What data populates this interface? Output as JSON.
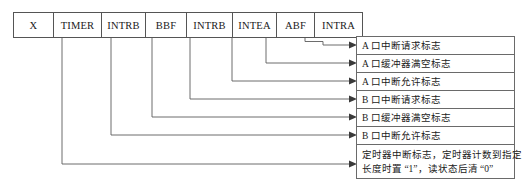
{
  "diagram": {
    "bitfield": {
      "cells": [
        {
          "label": "X",
          "width": 40
        },
        {
          "label": "TIMER",
          "width": 48
        },
        {
          "label": "INTRB",
          "width": 44
        },
        {
          "label": "BBF",
          "width": 41
        },
        {
          "label": "INTRB",
          "width": 46
        },
        {
          "label": "INTEA",
          "width": 44
        },
        {
          "label": "ABF",
          "width": 38
        },
        {
          "label": "INTRA",
          "width": 47
        }
      ]
    },
    "descriptions": [
      {
        "id": "intra",
        "text": "A 口中断请求标志"
      },
      {
        "id": "abf",
        "text": "A 口缓冲器满空标志"
      },
      {
        "id": "intea",
        "text": "A 口中断允许标志"
      },
      {
        "id": "intrb2",
        "text": "B 口中断请求标志"
      },
      {
        "id": "bbf",
        "text": "B 口缓冲器满空标志"
      },
      {
        "id": "intrb1",
        "text": "B 口中断允许标志"
      },
      {
        "id": "timer",
        "line1": "定时器中断标志，定时器计数到指定",
        "line2": "长度时置 “1”，读状态后清 “0”"
      }
    ],
    "colors": {
      "stroke": "#5c5c5c",
      "box_border": "#6a6a6a",
      "table_border": "#555555",
      "arrow": "#3a3a3a",
      "text": "#1a1a1a",
      "background": "#ffffff"
    }
  }
}
